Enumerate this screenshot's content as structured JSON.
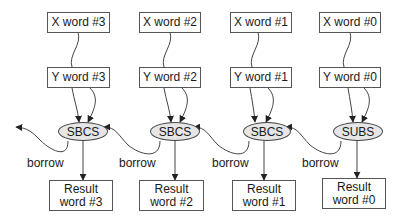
{
  "diagram": {
    "columns": [
      {
        "x_label": "X word #3",
        "y_label": "Y word #3",
        "op": "SBCS",
        "result_line1": "Result",
        "result_line2": "word #3",
        "borrow": "borrow"
      },
      {
        "x_label": "X word #2",
        "y_label": "Y word #2",
        "op": "SBCS",
        "result_line1": "Result",
        "result_line2": "word #2",
        "borrow": "borrow"
      },
      {
        "x_label": "X word #1",
        "y_label": "Y word #1",
        "op": "SBCS",
        "result_line1": "Result",
        "result_line2": "word #1",
        "borrow": "borrow"
      },
      {
        "x_label": "X word #0",
        "y_label": "Y word #0",
        "op": "SUBS",
        "result_line1": "Result",
        "result_line2": "word #0",
        "borrow": "borrow"
      }
    ],
    "colors": {
      "node_fill": "#e6e6e6",
      "stroke": "#444444",
      "text": "#1a1a1a"
    }
  }
}
